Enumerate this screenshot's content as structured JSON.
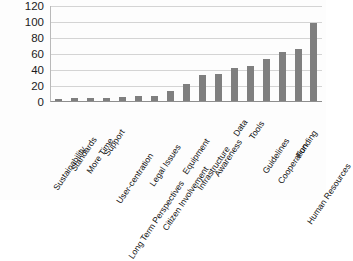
{
  "chart_data": {
    "type": "bar",
    "title": "",
    "subtitle": "",
    "xlabel": "",
    "ylabel": "",
    "ylim": [
      0,
      120
    ],
    "ytick_step": 20,
    "yticks": [
      120,
      100,
      80,
      60,
      40,
      20,
      0
    ],
    "grid": true,
    "grid_axis": "y",
    "legend": false,
    "legend_position": "none",
    "orientation": "vertical",
    "bar_color": "#7f7f7f",
    "categories": [
      "Sustainability",
      "Standards",
      "More Time",
      "Support",
      "User-centration",
      "Long Term Perspectives",
      "Legal Issues",
      "Citizen Involvement",
      "Equipment",
      "Infrastructure",
      "Awareness",
      "Data",
      "Tools",
      "Guidelines",
      "Cooperation",
      "Funding",
      "Human Resources"
    ],
    "values": [
      2,
      4,
      4,
      4,
      5,
      6,
      6,
      12,
      21,
      33,
      34,
      41,
      44,
      53,
      61,
      65,
      98
    ],
    "series": [
      {
        "name": "Count",
        "values": [
          2,
          4,
          4,
          4,
          5,
          6,
          6,
          12,
          21,
          33,
          34,
          41,
          44,
          53,
          61,
          65,
          98
        ]
      }
    ]
  },
  "axes": {
    "y_tick_labels": [
      "120",
      "100",
      "80",
      "60",
      "40",
      "20",
      "0"
    ]
  }
}
